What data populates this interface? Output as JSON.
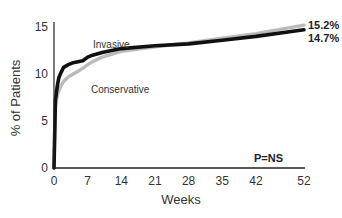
{
  "chart_data": {
    "type": "line",
    "title": "",
    "xlabel": "Weeks",
    "ylabel": "% of Patients",
    "xlim": [
      0,
      52
    ],
    "ylim": [
      0,
      15
    ],
    "x_ticks": [
      0,
      7,
      14,
      21,
      28,
      35,
      42,
      52
    ],
    "y_ticks": [
      0,
      5,
      10,
      15
    ],
    "grid": false,
    "legend": "inline labels",
    "series": [
      {
        "name": "Invasive",
        "color": "#111111",
        "x": [
          0,
          0.3,
          0.7,
          1,
          1.5,
          2,
          3,
          4,
          5,
          6,
          7,
          8,
          10,
          14,
          21,
          28,
          35,
          42,
          52
        ],
        "values": [
          0,
          7.2,
          8.8,
          9.6,
          10.2,
          10.7,
          11.0,
          11.2,
          11.3,
          11.4,
          11.8,
          12.0,
          12.3,
          12.7,
          13.0,
          13.2,
          13.6,
          14.0,
          14.7
        ],
        "end_label": "14.7%"
      },
      {
        "name": "Conservative",
        "color": "#bbbbbb",
        "x": [
          0,
          0.3,
          0.7,
          1,
          1.5,
          2,
          3,
          4,
          5,
          6,
          7,
          8,
          10,
          14,
          21,
          28,
          35,
          42,
          52
        ],
        "values": [
          0,
          6.5,
          7.8,
          8.2,
          8.8,
          9.2,
          9.7,
          10.0,
          10.3,
          10.6,
          11.0,
          11.3,
          11.8,
          12.4,
          12.9,
          13.3,
          13.8,
          14.3,
          15.2
        ],
        "end_label": "15.2%"
      }
    ],
    "annotations": [
      "Invasive",
      "Conservative",
      "P=NS",
      "15.2%",
      "14.7%"
    ]
  },
  "labels": {
    "invasive": "Invasive",
    "conservative": "Conservative",
    "p_value": "P=NS",
    "end_conservative": "15.2%",
    "end_invasive": "14.7%",
    "xlabel": "Weeks",
    "ylabel": "% of Patients"
  }
}
